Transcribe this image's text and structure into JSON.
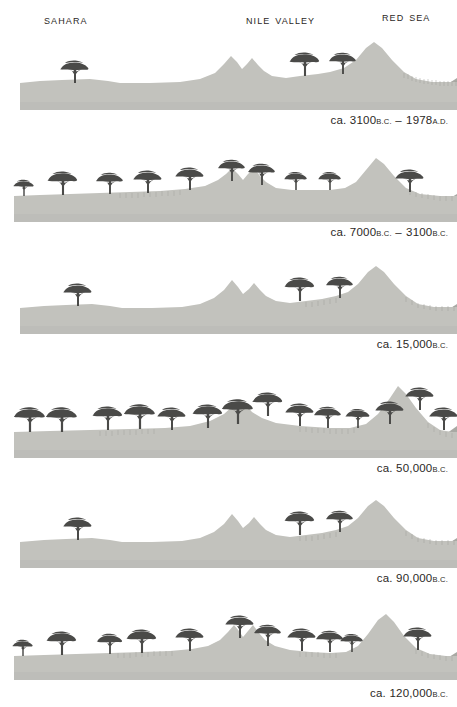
{
  "figure": {
    "colors": {
      "land": "#c2c2bd",
      "land_shade": "#b9b9b3",
      "sea": "#a9a9a4",
      "tree": "#4a4a48",
      "text": "#2b2825",
      "background": "#ffffff"
    }
  },
  "region_labels": [
    {
      "id": "sahara",
      "text": "Sahara"
    },
    {
      "id": "nile",
      "text": "Nile Valley"
    },
    {
      "id": "red_sea",
      "text": "Red Sea"
    }
  ],
  "panels": [
    {
      "id": "panel-1",
      "caption": {
        "prefix": "ca.",
        "from_value": "3100",
        "from_era": "B.C.",
        "dash": "–",
        "to_value": "1978",
        "to_era": "A.D.",
        "full": "ca. 3100 B.C. – 1978 A.D."
      },
      "climate": "arid",
      "tree_count": 3,
      "trees": [
        {
          "x": 75,
          "ground_y": 96,
          "scale": 1.0
        },
        {
          "x": 305,
          "ground_y": 82,
          "scale": 1.05
        },
        {
          "x": 343,
          "ground_y": 85,
          "scale": 0.95
        }
      ]
    },
    {
      "id": "panel-2",
      "caption": {
        "prefix": "ca.",
        "from_value": "7000",
        "from_era": "B.C.",
        "dash": "–",
        "to_value": "3100",
        "to_era": "B.C.",
        "full": "ca. 7000 B.C. – 3100 B.C."
      },
      "climate": "humid",
      "tree_count": 10,
      "trees": [
        {
          "x": 24,
          "ground_y": 92,
          "scale": 0.72
        },
        {
          "x": 63,
          "ground_y": 90,
          "scale": 1.05
        },
        {
          "x": 110,
          "ground_y": 88,
          "scale": 0.95
        },
        {
          "x": 148,
          "ground_y": 86,
          "scale": 1.0
        },
        {
          "x": 190,
          "ground_y": 82,
          "scale": 1.0
        },
        {
          "x": 232,
          "ground_y": 74,
          "scale": 0.95
        },
        {
          "x": 262,
          "ground_y": 78,
          "scale": 0.95
        },
        {
          "x": 296,
          "ground_y": 84,
          "scale": 0.8
        },
        {
          "x": 330,
          "ground_y": 84,
          "scale": 0.8
        },
        {
          "x": 410,
          "ground_y": 86,
          "scale": 1.0
        }
      ]
    },
    {
      "id": "panel-3",
      "caption": {
        "prefix": "ca.",
        "from_value": "15,000",
        "from_era": "B.C.",
        "dash": "",
        "to_value": "",
        "to_era": "",
        "full": "ca. 15,000 B.C."
      },
      "climate": "arid",
      "tree_count": 3,
      "trees": [
        {
          "x": 78,
          "ground_y": 94,
          "scale": 1.0
        },
        {
          "x": 300,
          "ground_y": 82,
          "scale": 1.05
        },
        {
          "x": 340,
          "ground_y": 86,
          "scale": 0.95
        }
      ]
    },
    {
      "id": "panel-4",
      "caption": {
        "prefix": "ca.",
        "from_value": "50,000",
        "from_era": "B.C.",
        "dash": "",
        "to_value": "",
        "to_era": "",
        "full": "ca. 50,000 B.C."
      },
      "climate": "very humid",
      "tree_count": 14,
      "trees": [
        {
          "x": 30,
          "ground_y": 100,
          "scale": 1.1
        },
        {
          "x": 62,
          "ground_y": 100,
          "scale": 1.1
        },
        {
          "x": 108,
          "ground_y": 96,
          "scale": 1.05
        },
        {
          "x": 140,
          "ground_y": 95,
          "scale": 1.1
        },
        {
          "x": 172,
          "ground_y": 96,
          "scale": 1.0
        },
        {
          "x": 208,
          "ground_y": 94,
          "scale": 1.05
        },
        {
          "x": 238,
          "ground_y": 90,
          "scale": 1.1
        },
        {
          "x": 268,
          "ground_y": 82,
          "scale": 1.05
        },
        {
          "x": 300,
          "ground_y": 92,
          "scale": 1.0
        },
        {
          "x": 328,
          "ground_y": 96,
          "scale": 0.95
        },
        {
          "x": 358,
          "ground_y": 100,
          "scale": 0.85
        },
        {
          "x": 390,
          "ground_y": 96,
          "scale": 1.0
        },
        {
          "x": 420,
          "ground_y": 82,
          "scale": 1.0
        },
        {
          "x": 442,
          "ground_y": 98,
          "scale": 1.0
        }
      ]
    },
    {
      "id": "panel-5",
      "caption": {
        "prefix": "ca.",
        "from_value": "90,000",
        "from_era": "B.C.",
        "dash": "",
        "to_value": "",
        "to_era": "",
        "full": "ca. 90,000 B.C."
      },
      "climate": "arid",
      "tree_count": 3,
      "trees": [
        {
          "x": 78,
          "ground_y": 94,
          "scale": 1.0
        },
        {
          "x": 300,
          "ground_y": 82,
          "scale": 1.05
        },
        {
          "x": 340,
          "ground_y": 86,
          "scale": 0.95
        }
      ]
    },
    {
      "id": "panel-6",
      "caption": {
        "prefix": "ca.",
        "from_value": "120,000",
        "from_era": "B.C.",
        "dash": "",
        "to_value": "",
        "to_era": "",
        "full": "ca. 120,000 B.C."
      },
      "climate": "humid",
      "tree_count": 11,
      "trees": [
        {
          "x": 23,
          "ground_y": 94,
          "scale": 0.72
        },
        {
          "x": 62,
          "ground_y": 92,
          "scale": 1.05
        },
        {
          "x": 110,
          "ground_y": 90,
          "scale": 0.9
        },
        {
          "x": 142,
          "ground_y": 86,
          "scale": 1.05
        },
        {
          "x": 190,
          "ground_y": 84,
          "scale": 1.0
        },
        {
          "x": 240,
          "ground_y": 74,
          "scale": 1.0
        },
        {
          "x": 268,
          "ground_y": 82,
          "scale": 0.95
        },
        {
          "x": 302,
          "ground_y": 86,
          "scale": 1.0
        },
        {
          "x": 330,
          "ground_y": 88,
          "scale": 0.95
        },
        {
          "x": 352,
          "ground_y": 92,
          "scale": 0.8
        },
        {
          "x": 418,
          "ground_y": 88,
          "scale": 1.0
        }
      ]
    }
  ]
}
